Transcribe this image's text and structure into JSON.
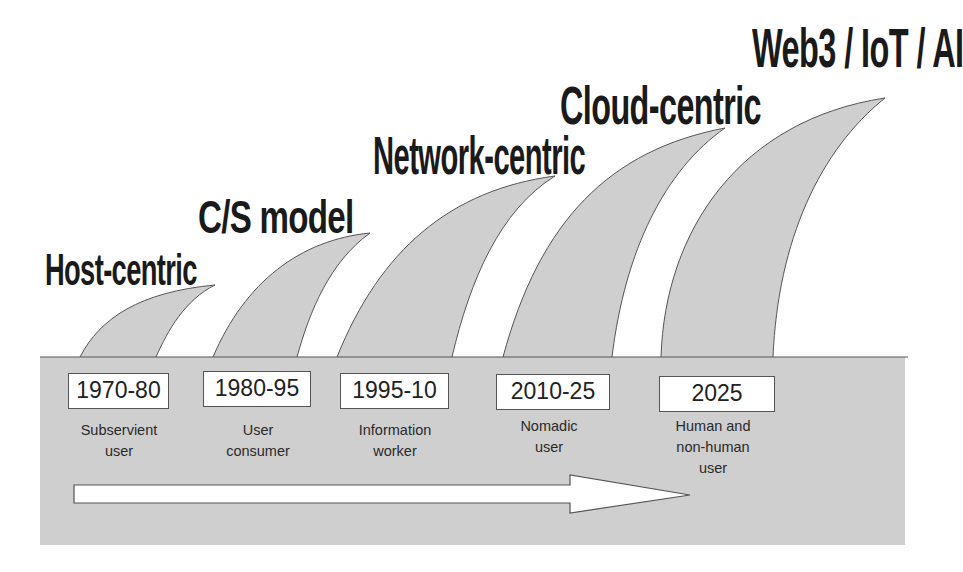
{
  "diagram": {
    "colors": {
      "band_fill": "#cfcfcf",
      "wave_fill": "#cfcfcf",
      "outline": "#555555",
      "title_text": "#1a1a1a",
      "box_fill": "#ffffff",
      "arrow_fill": "#ffffff"
    },
    "eras": [
      {
        "title": "Host-centric",
        "period": "1970-80",
        "user_line1": "Subservient",
        "user_line2": "user",
        "user_line3": ""
      },
      {
        "title": "C/S model",
        "period": "1980-95",
        "user_line1": "User",
        "user_line2": "consumer",
        "user_line3": ""
      },
      {
        "title": "Network-centric",
        "period": "1995-10",
        "user_line1": "Information",
        "user_line2": "worker",
        "user_line3": ""
      },
      {
        "title": "Cloud-centric",
        "period": "2010-25",
        "user_line1": "Nomadic",
        "user_line2": "user",
        "user_line3": ""
      },
      {
        "title": "Web3 / IoT / AI",
        "period": "2025",
        "user_line1": "Human and",
        "user_line2": "non-human",
        "user_line3": "user"
      }
    ],
    "arrow": {
      "direction": "right",
      "meaning": "time-progression-arrow"
    }
  }
}
